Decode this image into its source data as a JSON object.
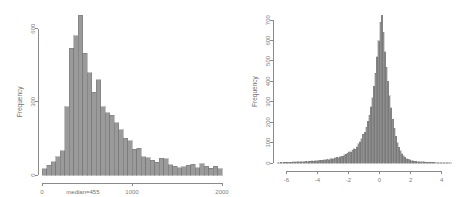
{
  "figure": {
    "background": "#ffffff",
    "bar_fill": "#9a9a9a",
    "bar_stroke": "#6b6b6b",
    "axis_color": "#8a8a8a",
    "text_color": "#6f6f6f"
  },
  "chart_data": [
    {
      "type": "bar",
      "id": "left-histogram",
      "title": "",
      "xlabel": "",
      "ylabel": "Frequency",
      "xlim": [
        0,
        2000
      ],
      "ylim": [
        0,
        660
      ],
      "xticks": [
        0,
        1000,
        2000
      ],
      "xticklabels": [
        "0",
        "1000",
        "2000"
      ],
      "yticks": [
        0,
        300,
        600
      ],
      "yticklabels": [
        "0",
        "300",
        "600"
      ],
      "grid": false,
      "legend": null,
      "annotations": [
        {
          "text": "median=455",
          "x": 455,
          "y": -70,
          "align": "center"
        }
      ],
      "bin_width": 50,
      "bin_starts": [
        0,
        50,
        100,
        150,
        200,
        250,
        300,
        350,
        400,
        450,
        500,
        550,
        600,
        650,
        700,
        750,
        800,
        850,
        900,
        950,
        1000,
        1050,
        1100,
        1150,
        1200,
        1250,
        1300,
        1350,
        1400,
        1450,
        1500,
        1550,
        1600,
        1650,
        1700,
        1750,
        1800,
        1850,
        1900,
        1950
      ],
      "values": [
        25,
        40,
        55,
        75,
        100,
        280,
        520,
        570,
        655,
        500,
        420,
        340,
        390,
        280,
        255,
        245,
        215,
        185,
        150,
        140,
        105,
        110,
        75,
        70,
        60,
        52,
        68,
        66,
        42,
        36,
        30,
        34,
        40,
        44,
        30,
        46,
        36,
        28,
        35,
        26
      ]
    },
    {
      "type": "bar",
      "id": "right-histogram",
      "title": "",
      "xlabel": "",
      "ylabel": "Frequency",
      "xlim": [
        -6.6,
        4.6
      ],
      "ylim": [
        0,
        730
      ],
      "xticks": [
        -6,
        -4,
        -2,
        0,
        2,
        4
      ],
      "xticklabels": [
        "-6",
        "-4",
        "-2",
        "0",
        "2",
        "4"
      ],
      "yticks": [
        0,
        100,
        200,
        300,
        400,
        500,
        600,
        700
      ],
      "yticklabels": [
        "0",
        "100",
        "200",
        "300",
        "400",
        "500",
        "600",
        "700"
      ],
      "grid": false,
      "legend": null,
      "annotations": [],
      "bin_width": 0.1,
      "bin_starts": [
        -6.6,
        -6.5,
        -6.4,
        -6.3,
        -6.2,
        -6.1,
        -6.0,
        -5.9,
        -5.8,
        -5.7,
        -5.6,
        -5.5,
        -5.4,
        -5.3,
        -5.2,
        -5.1,
        -5.0,
        -4.9,
        -4.8,
        -4.7,
        -4.6,
        -4.5,
        -4.4,
        -4.3,
        -4.2,
        -4.1,
        -4.0,
        -3.9,
        -3.8,
        -3.7,
        -3.6,
        -3.5,
        -3.4,
        -3.3,
        -3.2,
        -3.1,
        -3.0,
        -2.9,
        -2.8,
        -2.7,
        -2.6,
        -2.5,
        -2.4,
        -2.3,
        -2.2,
        -2.1,
        -2.0,
        -1.9,
        -1.8,
        -1.7,
        -1.6,
        -1.5,
        -1.4,
        -1.3,
        -1.2,
        -1.1,
        -1.0,
        -0.9,
        -0.8,
        -0.7,
        -0.6,
        -0.5,
        -0.4,
        -0.3,
        -0.2,
        -0.1,
        0.0,
        0.1,
        0.2,
        0.3,
        0.4,
        0.5,
        0.6,
        0.7,
        0.8,
        0.9,
        1.0,
        1.1,
        1.2,
        1.3,
        1.4,
        1.5,
        1.6,
        1.7,
        1.8,
        1.9,
        2.0,
        2.1,
        2.2,
        2.3,
        2.4,
        2.5,
        2.6,
        2.7,
        2.8,
        2.9,
        3.0,
        3.1,
        3.2,
        3.3,
        3.4,
        3.5,
        3.6,
        3.7,
        3.8,
        3.9,
        4.0,
        4.1,
        4.2,
        4.3,
        4.4,
        4.5
      ],
      "values": [
        2,
        2,
        3,
        2,
        3,
        3,
        4,
        3,
        4,
        4,
        5,
        4,
        5,
        6,
        5,
        6,
        7,
        6,
        8,
        7,
        9,
        8,
        10,
        9,
        11,
        12,
        11,
        13,
        14,
        13,
        16,
        15,
        18,
        17,
        20,
        22,
        21,
        25,
        27,
        26,
        31,
        34,
        33,
        40,
        44,
        48,
        55,
        52,
        62,
        70,
        68,
        80,
        95,
        105,
        120,
        140,
        150,
        175,
        205,
        235,
        275,
        320,
        375,
        440,
        520,
        600,
        690,
        725,
        640,
        545,
        470,
        400,
        330,
        270,
        215,
        170,
        130,
        100,
        78,
        60,
        46,
        36,
        28,
        22,
        18,
        15,
        12,
        10,
        9,
        8,
        7,
        6,
        6,
        5,
        5,
        4,
        4,
        4,
        3,
        3,
        3,
        3,
        2,
        2,
        2,
        2,
        2,
        2,
        1,
        1,
        1,
        1
      ]
    }
  ]
}
